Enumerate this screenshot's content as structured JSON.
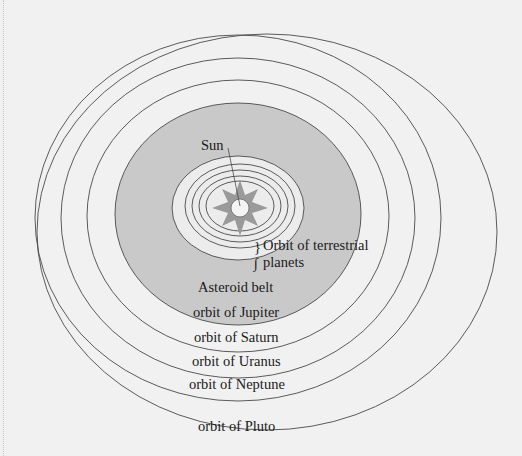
{
  "diagram": {
    "center_label": "Sun",
    "labels": {
      "sun": "Sun",
      "terrestrial_line1": "Orbit of terrestrial",
      "terrestrial_line2": "planets",
      "asteroid_belt": "Asteroid belt",
      "jupiter": "orbit of Jupiter",
      "saturn": "orbit of Saturn",
      "uranus": "orbit of Uranus",
      "neptune": "orbit of Neptune",
      "pluto": "orbit of Pluto"
    },
    "colors": {
      "background": "#f1f1f1",
      "asteroid_belt_fill": "#c9c9c9",
      "inner_region_fill": "#ececec",
      "sun_rays": "#9a9a9a",
      "sun_core": "#f4f4f4",
      "orbit_stroke": "#4a4a4a"
    },
    "orbits": [
      "terrestrial-1",
      "terrestrial-2",
      "terrestrial-3",
      "terrestrial-4",
      "jupiter",
      "saturn",
      "uranus",
      "neptune",
      "pluto"
    ]
  }
}
